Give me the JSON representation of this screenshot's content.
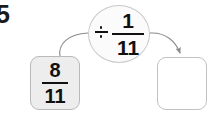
{
  "worksheet": {
    "problem_number": "5",
    "operand": {
      "numerator": "8",
      "denominator": "11"
    },
    "operator": {
      "symbol": "÷",
      "numerator": "1",
      "denominator": "11"
    },
    "answer": {
      "value": ""
    },
    "colors": {
      "operand_box_fill": "#ededed",
      "operand_box_border": "#b9b9b9",
      "answer_box_fill": "#ffffff",
      "answer_box_border": "#c2c2c2",
      "bubble_fill": "#fbfbfb",
      "bubble_border": "#c9c9c9",
      "arrow_stroke": "#8a8a8a",
      "text": "#111111",
      "background": "#ffffff"
    },
    "arrows": {
      "input_arrow_label": "from-operand-to-operator",
      "output_arrow_label": "from-operator-to-answer"
    }
  }
}
